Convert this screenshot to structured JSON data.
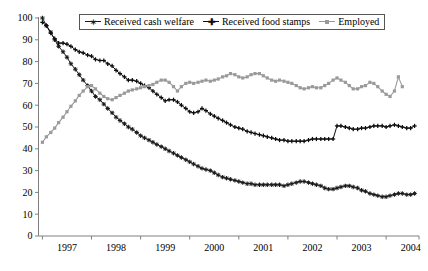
{
  "chart_data": {
    "type": "line",
    "title": "",
    "xlabel": "",
    "ylabel": "",
    "xlim": [
      1996.42,
      2004.17
    ],
    "ylim": [
      0,
      100
    ],
    "grid": false,
    "legend_position": "top-center",
    "y_ticks": [
      0,
      10,
      20,
      30,
      40,
      50,
      60,
      70,
      80,
      90,
      100
    ],
    "y_tick_labels": [
      "0",
      "10",
      "20",
      "30",
      "40",
      "50",
      "60",
      "70",
      "80",
      "90",
      "100"
    ],
    "x_ticks": [
      1996.5,
      1997.5,
      1998.5,
      1999.5,
      2000.5,
      2001.5,
      2002.5,
      2003.5,
      2004.17
    ],
    "x_tick_labels": [
      "1997",
      "1998",
      "1999",
      "2000",
      "2001",
      "2002",
      "2003",
      "2004"
    ],
    "x_label_positions": [
      1997.0,
      1998.0,
      1999.0,
      2000.0,
      2001.0,
      2002.0,
      2003.0,
      2004.0
    ],
    "series": [
      {
        "name": "Received cash welfare",
        "color": "#1a1a1a",
        "marker": "star",
        "x": [
          1996.5,
          1996.58,
          1996.67,
          1996.75,
          1996.83,
          1996.92,
          1997.0,
          1997.08,
          1997.17,
          1997.25,
          1997.33,
          1997.42,
          1997.5,
          1997.58,
          1997.67,
          1997.75,
          1997.83,
          1997.92,
          1998.0,
          1998.08,
          1998.17,
          1998.25,
          1998.33,
          1998.42,
          1998.5,
          1998.58,
          1998.67,
          1998.75,
          1998.83,
          1998.92,
          1999.0,
          1999.08,
          1999.17,
          1999.25,
          1999.33,
          1999.42,
          1999.5,
          1999.58,
          1999.67,
          1999.75,
          1999.83,
          1999.92,
          2000.0,
          2000.08,
          2000.17,
          2000.25,
          2000.33,
          2000.42,
          2000.5,
          2000.58,
          2000.67,
          2000.75,
          2000.83,
          2000.92,
          2001.0,
          2001.08,
          2001.17,
          2001.25,
          2001.33,
          2001.42,
          2001.5,
          2001.58,
          2001.67,
          2001.75,
          2001.83,
          2001.92,
          2002.0,
          2002.08,
          2002.17,
          2002.25,
          2002.33,
          2002.42,
          2002.5,
          2002.58,
          2002.67,
          2002.75,
          2002.83,
          2002.92,
          2003.0,
          2003.08,
          2003.17,
          2003.25,
          2003.33,
          2003.42,
          2003.5,
          2003.58,
          2003.67,
          2003.75,
          2003.83,
          2003.92,
          2004.0,
          2004.08
        ],
        "y": [
          100.0,
          96.5,
          93.5,
          90.0,
          87.0,
          84.5,
          82.0,
          79.0,
          76.5,
          74.0,
          71.5,
          69.0,
          66.5,
          64.0,
          62.5,
          60.5,
          58.5,
          56.5,
          54.5,
          53.0,
          51.5,
          50.0,
          49.0,
          47.5,
          46.0,
          45.0,
          44.0,
          43.0,
          42.0,
          41.0,
          40.0,
          39.0,
          38.0,
          37.0,
          36.0,
          35.0,
          34.0,
          33.0,
          32.0,
          31.0,
          30.5,
          30.0,
          29.0,
          28.0,
          27.0,
          26.5,
          26.0,
          25.5,
          25.0,
          24.5,
          24.0,
          24.0,
          23.5,
          23.5,
          23.5,
          23.5,
          23.5,
          23.5,
          23.5,
          23.0,
          23.5,
          24.0,
          24.5,
          25.0,
          25.0,
          24.5,
          24.0,
          23.5,
          23.0,
          22.0,
          21.5,
          21.5,
          22.0,
          22.5,
          23.0,
          23.0,
          22.5,
          22.0,
          21.0,
          20.5,
          19.5,
          19.0,
          18.5,
          18.0,
          18.0,
          18.5,
          19.0,
          19.5,
          19.5,
          19.0,
          19.0,
          19.5
        ]
      },
      {
        "name": "Received food stamps",
        "color": "#0d0d0d",
        "marker": "plus",
        "x": [
          1996.5,
          1996.58,
          1996.67,
          1996.75,
          1996.83,
          1996.92,
          1997.0,
          1997.08,
          1997.17,
          1997.25,
          1997.33,
          1997.42,
          1997.5,
          1997.58,
          1997.67,
          1997.75,
          1997.83,
          1997.92,
          1998.0,
          1998.08,
          1998.17,
          1998.25,
          1998.33,
          1998.42,
          1998.5,
          1998.58,
          1998.67,
          1998.75,
          1998.83,
          1998.92,
          1999.0,
          1999.08,
          1999.17,
          1999.25,
          1999.33,
          1999.42,
          1999.5,
          1999.58,
          1999.67,
          1999.75,
          1999.83,
          1999.92,
          2000.0,
          2000.08,
          2000.17,
          2000.25,
          2000.33,
          2000.42,
          2000.5,
          2000.58,
          2000.67,
          2000.75,
          2000.83,
          2000.92,
          2001.0,
          2001.08,
          2001.17,
          2001.25,
          2001.33,
          2001.42,
          2001.5,
          2001.58,
          2001.67,
          2001.75,
          2001.83,
          2001.92,
          2002.0,
          2002.08,
          2002.17,
          2002.25,
          2002.33,
          2002.42,
          2002.5,
          2002.58,
          2002.67,
          2002.75,
          2002.83,
          2002.92,
          2003.0,
          2003.08,
          2003.17,
          2003.25,
          2003.33,
          2003.42,
          2003.5,
          2003.58,
          2003.67,
          2003.75,
          2003.83,
          2003.92,
          2004.0,
          2004.08
        ],
        "y": [
          98.0,
          96.5,
          93.0,
          90.5,
          88.5,
          88.5,
          88.0,
          87.0,
          85.5,
          84.5,
          84.0,
          83.0,
          82.5,
          81.0,
          80.5,
          80.5,
          79.0,
          78.0,
          76.0,
          74.5,
          73.0,
          71.5,
          71.5,
          71.0,
          70.0,
          69.0,
          68.0,
          66.5,
          65.0,
          63.5,
          62.0,
          62.5,
          62.5,
          61.5,
          60.0,
          58.5,
          57.0,
          56.5,
          57.0,
          58.5,
          57.5,
          56.0,
          55.0,
          54.0,
          53.0,
          52.0,
          51.0,
          50.0,
          49.5,
          49.0,
          48.0,
          47.5,
          47.0,
          46.5,
          46.0,
          45.5,
          45.0,
          44.5,
          44.0,
          44.0,
          43.5,
          43.5,
          43.5,
          43.5,
          43.5,
          44.0,
          44.5,
          44.5,
          44.5,
          44.5,
          44.5,
          44.5,
          50.5,
          50.5,
          50.0,
          49.5,
          49.0,
          49.0,
          49.5,
          49.5,
          50.0,
          50.5,
          50.5,
          50.5,
          50.0,
          50.5,
          51.0,
          50.5,
          50.0,
          49.5,
          49.5,
          50.5
        ]
      },
      {
        "name": "Employed",
        "color": "#9a9a9a",
        "marker": "square",
        "x": [
          1996.5,
          1996.58,
          1996.67,
          1996.75,
          1996.83,
          1996.92,
          1997.0,
          1997.08,
          1997.17,
          1997.25,
          1997.33,
          1997.42,
          1997.5,
          1997.58,
          1997.67,
          1997.75,
          1997.83,
          1997.92,
          1998.0,
          1998.08,
          1998.17,
          1998.25,
          1998.33,
          1998.42,
          1998.5,
          1998.58,
          1998.67,
          1998.75,
          1998.83,
          1998.92,
          1999.0,
          1999.08,
          1999.17,
          1999.25,
          1999.33,
          1999.42,
          1999.5,
          1999.58,
          1999.67,
          1999.75,
          1999.83,
          1999.92,
          2000.0,
          2000.08,
          2000.17,
          2000.25,
          2000.33,
          2000.42,
          2000.5,
          2000.58,
          2000.67,
          2000.75,
          2000.83,
          2000.92,
          2001.0,
          2001.08,
          2001.17,
          2001.25,
          2001.33,
          2001.42,
          2001.5,
          2001.58,
          2001.67,
          2001.75,
          2001.83,
          2001.92,
          2002.0,
          2002.08,
          2002.17,
          2002.25,
          2002.33,
          2002.42,
          2002.5,
          2002.58,
          2002.67,
          2002.75,
          2002.83,
          2002.92,
          2003.0,
          2003.08,
          2003.17,
          2003.25,
          2003.33,
          2003.42,
          2003.5
        ],
        "y": [
          43.0,
          45.5,
          47.5,
          49.5,
          52.0,
          54.5,
          57.0,
          59.5,
          62.0,
          64.5,
          66.5,
          68.5,
          69.0,
          67.5,
          65.5,
          64.0,
          63.0,
          62.5,
          63.5,
          64.5,
          65.5,
          66.5,
          67.0,
          67.5,
          68.0,
          68.5,
          69.0,
          69.5,
          70.5,
          71.5,
          71.5,
          70.5,
          68.5,
          66.5,
          68.5,
          70.0,
          70.5,
          70.0,
          70.5,
          71.0,
          71.5,
          71.0,
          71.5,
          72.0,
          73.0,
          73.5,
          74.5,
          74.0,
          73.0,
          72.5,
          73.0,
          74.0,
          74.5,
          74.5,
          73.5,
          72.5,
          71.5,
          71.0,
          71.5,
          71.0,
          70.5,
          70.0,
          69.0,
          68.0,
          67.5,
          68.0,
          68.5,
          68.0,
          68.0,
          69.0,
          70.0,
          71.5,
          72.5,
          71.5,
          70.5,
          69.0,
          67.5,
          67.5,
          68.5,
          69.0,
          70.5,
          70.0,
          68.5,
          66.5,
          65.0
        ]
      }
    ],
    "series_extra": {
      "employed_tail_x": [
        1996.5,
        1996.58,
        1996.67,
        1996.75,
        1996.83,
        1996.92,
        1997.0
      ],
      "employed_tail_note": ""
    },
    "employed_late_x": [
      2003.5,
      2003.58,
      2003.67,
      2003.75,
      2003.83
    ],
    "employed_late_y": [
      65.0,
      64.0,
      66.5,
      73.0,
      68.5
    ]
  },
  "legend": {
    "entries": [
      {
        "label": "Received cash welfare",
        "marker": "star-marker",
        "color": "#1a1a1a"
      },
      {
        "label": "Received food stamps",
        "marker": "plus-marker",
        "color": "#0d0d0d"
      },
      {
        "label": "Employed",
        "marker": "square-marker",
        "color": "#9a9a9a"
      }
    ]
  },
  "axes": {
    "y_title": "",
    "x_title": ""
  }
}
